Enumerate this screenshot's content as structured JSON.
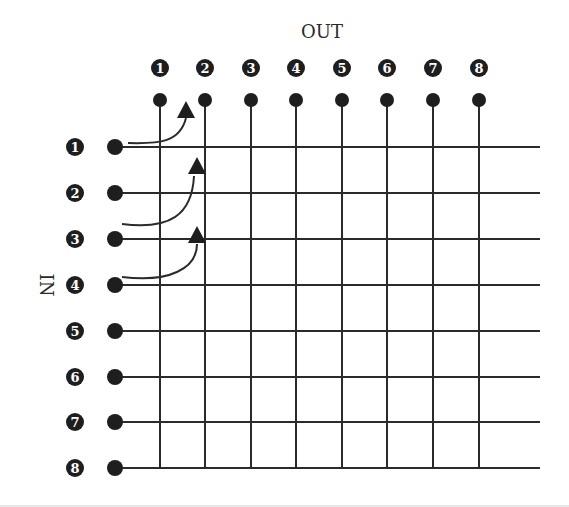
{
  "diagram": {
    "title_out": "OUT",
    "title_in": "IN",
    "outputs": [
      "1",
      "2",
      "3",
      "4",
      "5",
      "6",
      "7",
      "8"
    ],
    "inputs": [
      "1",
      "2",
      "3",
      "4",
      "5",
      "6",
      "7",
      "8"
    ],
    "connections": [
      {
        "input": "1",
        "output": "1",
        "label": "Input 1 routed to Output 1"
      },
      {
        "input": "3",
        "output": "2",
        "label": "Input 3 routed to Output 2"
      },
      {
        "input": "4",
        "output": "2",
        "label": "Input 4 routed to Output 2"
      }
    ],
    "colors": {
      "line": "#2b2b2b",
      "dot": "#1e1e1e",
      "badge": "#1e1e1e",
      "badge_text": "#ffffff",
      "background": "#ffffff"
    }
  }
}
